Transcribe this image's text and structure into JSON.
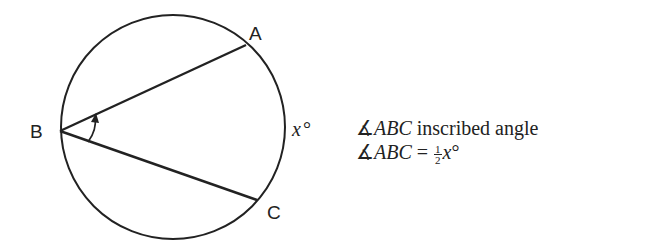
{
  "diagram": {
    "type": "inscribed-angle",
    "circle": {
      "cx": 173,
      "cy": 127,
      "r": 112
    },
    "points": {
      "A": {
        "label": "A",
        "x": 246,
        "y": 45
      },
      "B": {
        "label": "B",
        "x": 60,
        "y": 131
      },
      "C": {
        "label": "C",
        "x": 257,
        "y": 200
      }
    },
    "arc_label": "x°",
    "arc_label_var": "x",
    "arc_label_unit": "°"
  },
  "notes": {
    "line1": {
      "symbol": "∡",
      "name": "ABC",
      "text": " inscribed angle"
    },
    "line2": {
      "symbol": "∡",
      "name": "ABC",
      "eq": " = ",
      "frac_num": "1",
      "frac_den": "2",
      "var": "x",
      "unit": "°"
    }
  }
}
